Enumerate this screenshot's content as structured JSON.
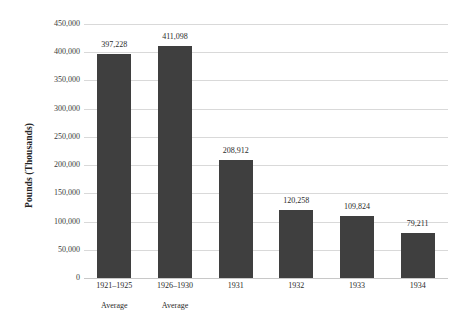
{
  "chart_data": {
    "type": "bar",
    "title": "",
    "subtitle": "",
    "xlabel": "",
    "ylabel": "Pounds (Thousands)",
    "ylim": [
      0,
      450000
    ],
    "ytick_step": 50000,
    "grid": true,
    "legend": false,
    "bar_color": "#3F3F3F",
    "gridline_color": "#D9D9D9",
    "background_color": "#FFFFFF",
    "categories": [
      "1921–1925 Average",
      "1926–1930 Average",
      "1931",
      "1932",
      "1933",
      "1934"
    ],
    "values": [
      397228,
      411098,
      208912,
      120258,
      109824,
      79211
    ],
    "value_labels": [
      "397,228",
      "411,098",
      "208,912",
      "120,258",
      "109,824",
      "79,211"
    ],
    "category_lines": [
      [
        "1921–1925",
        "Average"
      ],
      [
        "1926–1930",
        "Average"
      ],
      [
        "1931",
        ""
      ],
      [
        "1932",
        ""
      ],
      [
        "1933",
        ""
      ],
      [
        "1934",
        ""
      ]
    ],
    "ytick_labels": [
      "450,000",
      "400,000",
      "350,000",
      "300,000",
      "250,000",
      "200,000",
      "150,000",
      "100,000",
      "50,000",
      "0"
    ],
    "ytick_values": [
      450000,
      400000,
      350000,
      300000,
      250000,
      200000,
      150000,
      100000,
      50000,
      0
    ]
  }
}
